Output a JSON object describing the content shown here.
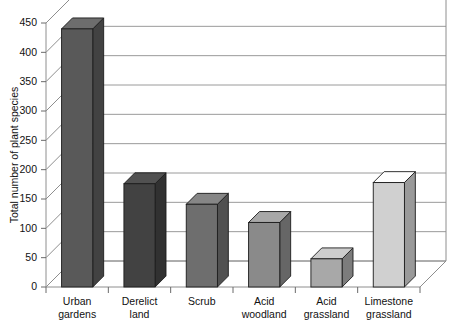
{
  "chart_data": {
    "type": "bar",
    "title": "",
    "xlabel": "",
    "ylabel": "Total number of plant species",
    "categories": [
      "Urban gardens",
      "Derelict land",
      "Scrub",
      "Acid woodland",
      "Acid grassland",
      "Limestone grassland"
    ],
    "category_lines": [
      [
        "Urban",
        "gardens"
      ],
      [
        "Derelict",
        "land"
      ],
      [
        "Scrub",
        ""
      ],
      [
        "Acid",
        "woodland"
      ],
      [
        "Acid",
        "grassland"
      ],
      [
        "Limestone",
        "grassland"
      ]
    ],
    "values": [
      440,
      176,
      141,
      110,
      48,
      178
    ],
    "bar_colors": [
      "#595959",
      "#424242",
      "#6e6e6e",
      "#8a8a8a",
      "#a8a8a8",
      "#d0d0d0"
    ],
    "ylim": [
      0,
      450
    ],
    "ytick_values": [
      0,
      50,
      100,
      150,
      200,
      250,
      300,
      350,
      400,
      450
    ],
    "ytick_labels": [
      "0",
      "50",
      "100",
      "150",
      "200",
      "250",
      "300",
      "350",
      "400",
      "450"
    ],
    "grid": true,
    "legend": "none",
    "style": "3d-column"
  },
  "axes": {
    "y_axis_title": "Total number of plant species"
  }
}
